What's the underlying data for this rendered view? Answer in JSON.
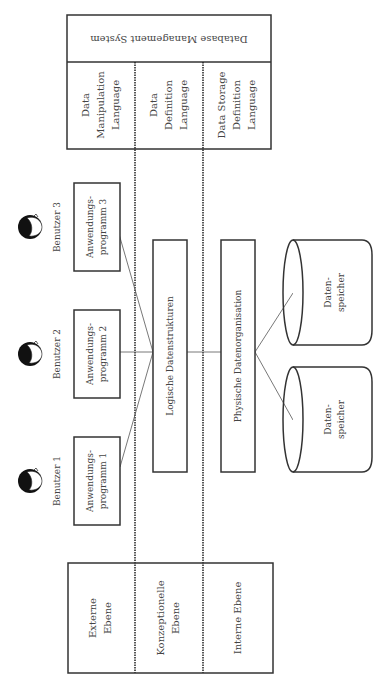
{
  "dbms": {
    "title": "Database Management System",
    "languages": [
      {
        "lines": [
          "Data",
          "Manipulation",
          "Language"
        ]
      },
      {
        "lines": [
          "Data",
          "Definition",
          "Language"
        ]
      },
      {
        "lines": [
          "Data Storage",
          "Definition",
          "Language"
        ]
      }
    ]
  },
  "levels": [
    {
      "lines": [
        "Externe",
        "Ebene"
      ]
    },
    {
      "lines": [
        "Konzeptionelle",
        "Ebene"
      ]
    },
    {
      "lines": [
        "Interne Ebene"
      ]
    }
  ],
  "users": [
    {
      "label": "Benutzer 1",
      "program": [
        "Anwendungs-",
        "programm 1"
      ]
    },
    {
      "label": "Benutzer 2",
      "program": [
        "Anwendungs-",
        "programm 2"
      ]
    },
    {
      "label": "Benutzer 3",
      "program": [
        "Anwendungs-",
        "programm 3"
      ]
    }
  ],
  "logical": {
    "label": "Logische Datenstrukturen"
  },
  "physical": {
    "label": "Physische Datenorganisation"
  },
  "storage": [
    {
      "lines": [
        "Daten-",
        "speicher"
      ]
    },
    {
      "lines": [
        "Daten-",
        "speicher"
      ]
    }
  ],
  "colors": {
    "stroke": "#333333",
    "text": "#444444",
    "hair": "#111111"
  }
}
